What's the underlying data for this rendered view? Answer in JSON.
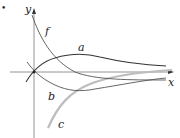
{
  "figure": {
    "bullet": "•",
    "axes": {
      "x_label": "x",
      "y_label": "y"
    },
    "curves": [
      {
        "name": "f",
        "label": "f",
        "description": "decreasing curve approaching x-axis",
        "color": "#555555"
      },
      {
        "name": "a",
        "label": "a",
        "description": "starts at origin, rises to maximum, decays toward axis",
        "color": "#333333"
      },
      {
        "name": "b",
        "label": "b",
        "description": "starts at origin, dips to minimum, rises toward axis",
        "color": "#555555"
      },
      {
        "name": "c",
        "label": "c",
        "description": "increasing from far below, approaching x-axis",
        "color": "#bdbdbd"
      }
    ],
    "colors": {
      "axis": "#888888",
      "dark_curve": "#333333",
      "medium_curve": "#555555",
      "light_curve": "#bdbdbd"
    }
  }
}
